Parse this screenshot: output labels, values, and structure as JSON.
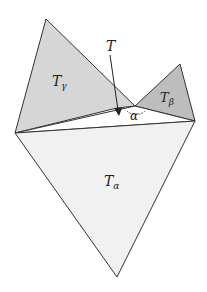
{
  "diagram": {
    "triangles": {
      "gamma": {
        "label": "T",
        "subscript": "γ",
        "fill": "#d6d6d6"
      },
      "beta": {
        "label": "T",
        "subscript": "β",
        "fill": "#bdbdbd"
      },
      "alpha": {
        "label": "T",
        "subscript": "α",
        "fill": "#f1f1f1"
      },
      "center": {
        "label": "T",
        "fill": "#ffffff"
      }
    },
    "angle_label": "α",
    "stroke_color": "#333333"
  }
}
